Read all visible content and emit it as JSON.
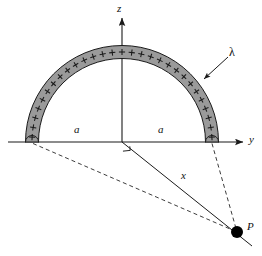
{
  "figure": {
    "background_color": "#ffffff",
    "stroke_color": "#1a1a1a",
    "rod_fill_color": "#9a9a9a",
    "rod_edge_color": "#1a1a1a",
    "point_color": "#000000"
  },
  "axes": {
    "z_label": "z",
    "y_label": "y",
    "origin": {
      "x": 122,
      "y": 142
    },
    "z_axis": {
      "x": 122,
      "y_top": 14,
      "y_bottom": 142,
      "arrow": "up"
    },
    "y_axis": {
      "y": 142,
      "x_left": 8,
      "x_right": 246,
      "arrow": "right"
    }
  },
  "rod": {
    "shape": "semicircle",
    "center": {
      "x": 122,
      "y": 142
    },
    "radius": 90,
    "thickness": 13,
    "charge_symbol": "+",
    "charge_count": 29,
    "charge_sign": "positive",
    "orientation": "upper half-plane"
  },
  "labels": {
    "lambda": "λ",
    "radius_left": "a",
    "radius_right": "a",
    "distance": "x",
    "point": "P",
    "z_axis": "z",
    "y_axis": "y"
  },
  "annotations": {
    "lambda_leader": {
      "from": {
        "x": 227,
        "y": 58
      },
      "to": {
        "x": 203,
        "y": 80
      },
      "arrow": true,
      "style": "solid"
    },
    "radius_left_span": {
      "from_x": 33,
      "to_x": 122,
      "y": 142
    },
    "radius_right_span": {
      "from_x": 122,
      "to_x": 212,
      "y": 142
    },
    "right_angle_marker": {
      "at": {
        "x": 122,
        "y": 142
      },
      "size": 9
    }
  },
  "point_P": {
    "label": "P",
    "x": 237,
    "y": 232,
    "radius": 6
  },
  "lines": [
    {
      "name": "distance-x-line",
      "style": "solid",
      "from": {
        "x": 122,
        "y": 142
      },
      "to": {
        "x": 252,
        "y": 246
      },
      "label": "x"
    },
    {
      "name": "left-end-to-P-line",
      "style": "dashed",
      "from": {
        "x": 33,
        "y": 142
      },
      "to": {
        "x": 237,
        "y": 232
      }
    },
    {
      "name": "right-end-to-P-line",
      "style": "dashed",
      "from": {
        "x": 212,
        "y": 142
      },
      "to": {
        "x": 237,
        "y": 232
      }
    }
  ]
}
